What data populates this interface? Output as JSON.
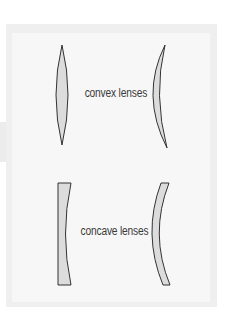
{
  "diagram": {
    "labels": {
      "convex": "convex lenses",
      "concave": "concave lenses"
    },
    "lenses": [
      {
        "name": "biconvex-lens",
        "group": "convex"
      },
      {
        "name": "convex-meniscus-lens",
        "group": "convex"
      },
      {
        "name": "plano-concave-lens",
        "group": "concave"
      },
      {
        "name": "concave-meniscus-lens",
        "group": "concave"
      }
    ],
    "colors": {
      "page_background": "#ffffff",
      "panel_background": "#efefef",
      "inner_background": "#f7f7f7",
      "lens_fill": "#dcdcdc",
      "lens_stroke": "#333333",
      "text": "#3a3a3a"
    }
  }
}
